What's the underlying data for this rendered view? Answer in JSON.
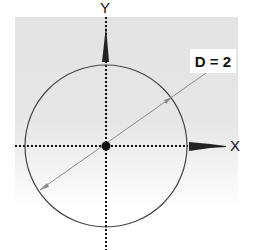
{
  "diagram": {
    "axes": {
      "x_label": "X",
      "y_label": "Y"
    },
    "circle": {
      "label": "D = 2",
      "diameter": 2
    },
    "colors": {
      "background_panel": "#e4e4e4",
      "stroke": "#333333",
      "diameter_line": "#888888",
      "label_box": "#ffffff"
    }
  }
}
